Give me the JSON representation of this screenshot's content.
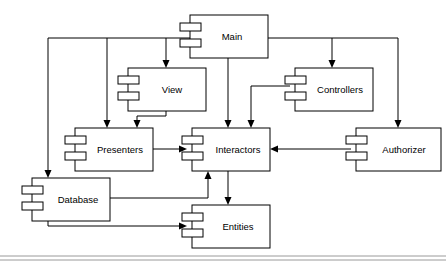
{
  "diagram": {
    "type": "uml-component-diagram",
    "style": {
      "box_fill": "#ffffff",
      "box_stroke": "#000000",
      "line_color": "#000000",
      "background": "#ffffff",
      "frame_color": "#9a9a9a"
    },
    "components": [
      {
        "id": "main",
        "label": "Main",
        "x": 190,
        "y": 15,
        "w": 78,
        "h": 43
      },
      {
        "id": "view",
        "label": "View",
        "x": 128,
        "y": 68,
        "w": 78,
        "h": 43
      },
      {
        "id": "controllers",
        "label": "Controllers",
        "x": 295,
        "y": 68,
        "w": 78,
        "h": 43
      },
      {
        "id": "presenters",
        "label": "Presenters",
        "x": 75,
        "y": 128,
        "w": 78,
        "h": 43
      },
      {
        "id": "interactors",
        "label": "Interactors",
        "x": 192,
        "y": 128,
        "w": 78,
        "h": 43
      },
      {
        "id": "authorizer",
        "label": "Authorizer",
        "x": 356,
        "y": 128,
        "w": 85,
        "h": 43
      },
      {
        "id": "database",
        "label": "Database",
        "x": 32,
        "y": 178,
        "w": 78,
        "h": 43
      },
      {
        "id": "entities",
        "label": "Entities",
        "x": 192,
        "y": 205,
        "w": 78,
        "h": 43
      }
    ],
    "connections": [
      {
        "id": "main-to-view",
        "from": "main",
        "to": "view",
        "label": "Main depends on View"
      },
      {
        "id": "main-to-presenters",
        "from": "main",
        "to": "presenters",
        "label": "Main depends on Presenters"
      },
      {
        "id": "main-to-database",
        "from": "main",
        "to": "database",
        "label": "Main depends on Database"
      },
      {
        "id": "main-to-interactors",
        "from": "main",
        "to": "interactors",
        "label": "Main depends on Interactors"
      },
      {
        "id": "main-to-controllers",
        "from": "main",
        "to": "controllers",
        "label": "Main depends on Controllers"
      },
      {
        "id": "main-to-authorizer",
        "from": "main",
        "to": "authorizer",
        "label": "Main depends on Authorizer"
      },
      {
        "id": "view-to-presenters",
        "from": "view",
        "to": "presenters",
        "label": "View implemented by Presenters"
      },
      {
        "id": "presenters-to-interactors",
        "from": "presenters",
        "to": "interactors",
        "label": "Presenters used by Interactors"
      },
      {
        "id": "controllers-to-interactors",
        "from": "controllers",
        "to": "interactors",
        "label": "Controllers depend on Interactors"
      },
      {
        "id": "authorizer-to-interactors",
        "from": "authorizer",
        "to": "interactors",
        "label": "Authorizer used by Interactors"
      },
      {
        "id": "database-to-interactors",
        "from": "database",
        "to": "interactors",
        "label": "Database used by Interactors"
      },
      {
        "id": "interactors-to-entities",
        "from": "interactors",
        "to": "entities",
        "label": "Interactors depend on Entities"
      },
      {
        "id": "database-to-entities",
        "from": "database",
        "to": "entities",
        "label": "Database depends on Entities"
      }
    ]
  }
}
